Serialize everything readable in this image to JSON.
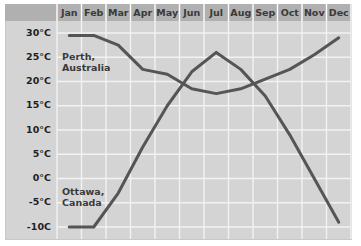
{
  "chart_data": {
    "type": "line",
    "title": "",
    "xlabel": "",
    "ylabel": "",
    "categories": [
      "Jan",
      "Feb",
      "Mar",
      "Apr",
      "May",
      "Jun",
      "Jul",
      "Aug",
      "Sep",
      "Oct",
      "Nov",
      "Dec"
    ],
    "ylim": [
      -10,
      30
    ],
    "yticks": [
      30,
      25,
      20,
      15,
      10,
      5,
      0,
      -5,
      -10
    ],
    "ytick_labels": [
      "30°C",
      "25°C",
      "20°C",
      "15°C",
      "10°C",
      "5°C",
      "0°C",
      "-5°C",
      "-10C"
    ],
    "grid": true,
    "legend_position": "inline-labels",
    "series": [
      {
        "name": "Perth, Australia",
        "label_lines": [
          "Perth,",
          "Australia"
        ],
        "color": "#555555",
        "values": [
          29.5,
          29.5,
          27.5,
          22.5,
          21.5,
          18.5,
          17.5,
          18.5,
          20.5,
          22.5,
          25.5,
          29.0
        ]
      },
      {
        "name": "Ottawa, Canada",
        "label_lines": [
          "Ottawa,",
          "Canada"
        ],
        "color": "#555555",
        "values": [
          -10.0,
          -10.0,
          -3.0,
          6.5,
          15.0,
          22.0,
          26.0,
          22.5,
          17.0,
          9.0,
          0.0,
          -9.0
        ]
      }
    ]
  },
  "colors": {
    "plot_background": "#d4d4d4",
    "header_background": "#b0b0b0",
    "gridline": "#f2f2f2",
    "line": "#555555",
    "border": "#c9c9c9",
    "page_background": "#ffffff"
  }
}
